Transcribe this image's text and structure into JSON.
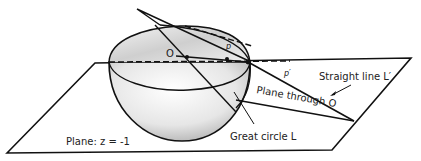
{
  "figure": {
    "labels": {
      "origin": "O",
      "point_p": "p",
      "point_p_prime": "p′",
      "straight_line": "Straight line L′",
      "plane_through_o": "Plane through O",
      "great_circle": "Great circle L",
      "plane_z": "Plane: z = -1"
    },
    "colors": {
      "stroke": "#111111",
      "shade_dark": "#9a9a9a",
      "shade_light": "#ffffff",
      "background": "#ffffff"
    }
  }
}
